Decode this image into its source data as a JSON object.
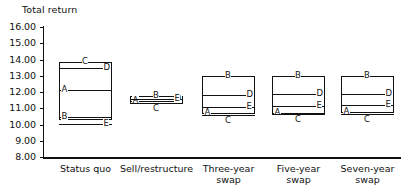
{
  "chart_data": {
    "type": "bar",
    "title": "",
    "ylabel": "Total return",
    "xlabel": "",
    "ylim": [
      8.0,
      16.0
    ],
    "ytick_labels": [
      "16.00",
      "15.00",
      "14.00",
      "13.00",
      "12.00",
      "11.00",
      "10.00",
      "9.00",
      "8.00"
    ],
    "ytick_values": [
      16.0,
      15.0,
      14.0,
      13.0,
      12.0,
      11.0,
      10.0,
      9.0,
      8.0
    ],
    "grid": false,
    "legend": "none",
    "categories": [
      "Status quo",
      "Sell/restructure",
      "Three-year swap",
      "Five-year swap",
      "Seven-year swap"
    ],
    "series": [
      {
        "name": "A",
        "values": [
          12.15,
          11.42,
          10.68,
          10.72,
          10.78
        ]
      },
      {
        "name": "B",
        "values": [
          10.35,
          11.72,
          13.0,
          13.0,
          13.0
        ]
      },
      {
        "name": "C",
        "values": [
          13.85,
          11.3,
          10.6,
          10.62,
          10.64
        ]
      },
      {
        "name": "D",
        "values": [
          13.45,
          11.55,
          11.82,
          11.85,
          11.88
        ]
      },
      {
        "name": "E",
        "values": [
          10.05,
          11.55,
          11.1,
          11.12,
          11.18
        ]
      }
    ],
    "groups": [
      {
        "category": "Status quo",
        "box_top": 13.85,
        "box_bottom": 10.3,
        "lines": [
          {
            "label": "C",
            "value": 13.85,
            "label_pos": "center-top"
          },
          {
            "label": "D",
            "value": 13.45,
            "label_pos": "right"
          },
          {
            "label": "A",
            "value": 12.15,
            "label_pos": "left"
          },
          {
            "label": "B",
            "value": 10.45,
            "label_pos": "left"
          },
          {
            "label": "E",
            "value": 10.05,
            "label_pos": "right"
          }
        ]
      },
      {
        "category": "Sell/restructure",
        "box_top": 11.78,
        "box_bottom": 11.28,
        "lines": [
          {
            "label": "B",
            "value": 11.78,
            "label_pos": "center-top"
          },
          {
            "label": "A",
            "value": 11.42,
            "label_pos": "left"
          },
          {
            "label": "C",
            "value": 11.3,
            "label_pos": "center-bottom"
          },
          {
            "label": "D",
            "value": 11.55,
            "label_pos": "right"
          },
          {
            "label": "E",
            "value": 11.55,
            "label_pos": "right"
          }
        ]
      },
      {
        "category": "Three-year\nswap",
        "box_top": 13.0,
        "box_bottom": 10.62,
        "lines": [
          {
            "label": "B",
            "value": 13.0,
            "label_pos": "center-top"
          },
          {
            "label": "D",
            "value": 11.82,
            "label_pos": "right"
          },
          {
            "label": "E",
            "value": 11.1,
            "label_pos": "right"
          },
          {
            "label": "A",
            "value": 10.68,
            "label_pos": "left"
          },
          {
            "label": "C",
            "value": 10.6,
            "label_pos": "center-bottom"
          }
        ]
      },
      {
        "category": "Five-year\nswap",
        "box_top": 13.0,
        "box_bottom": 10.64,
        "lines": [
          {
            "label": "B",
            "value": 13.0,
            "label_pos": "center-top"
          },
          {
            "label": "D",
            "value": 11.85,
            "label_pos": "right"
          },
          {
            "label": "E",
            "value": 11.12,
            "label_pos": "right"
          },
          {
            "label": "A",
            "value": 10.72,
            "label_pos": "left"
          },
          {
            "label": "C",
            "value": 10.62,
            "label_pos": "center-bottom"
          }
        ]
      },
      {
        "category": "Seven-year\nswap",
        "box_top": 13.0,
        "box_bottom": 10.68,
        "lines": [
          {
            "label": "B",
            "value": 13.0,
            "label_pos": "center-top"
          },
          {
            "label": "D",
            "value": 11.88,
            "label_pos": "right"
          },
          {
            "label": "E",
            "value": 11.18,
            "label_pos": "right"
          },
          {
            "label": "A",
            "value": 10.78,
            "label_pos": "left"
          },
          {
            "label": "C",
            "value": 10.64,
            "label_pos": "center-bottom"
          }
        ]
      }
    ]
  },
  "axis": {
    "y_title": "Total return",
    "ticks": [
      "16.00",
      "15.00",
      "14.00",
      "13.00",
      "12.00",
      "11.00",
      "10.00",
      "9.00",
      "8.00"
    ]
  },
  "xlabels": [
    "Status quo",
    "Sell/restructure",
    "Three-year\nswap",
    "Five-year\nswap",
    "Seven-year\nswap"
  ],
  "colors": {
    "ink": "#111111",
    "background": "#ffffff"
  }
}
